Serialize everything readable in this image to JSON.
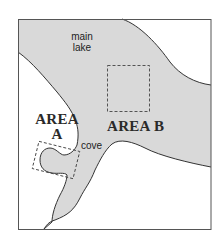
{
  "map": {
    "colors": {
      "water": "#d9d9d9",
      "land": "#ffffff",
      "shoreline": "#333333",
      "frame": "#555555",
      "area_box": "#444444"
    },
    "labels": {
      "main_lake_line1": "main",
      "main_lake_line2": "lake",
      "area_a_line1": "AREA",
      "area_a_line2": "A",
      "area_b": "AREA B",
      "cove": "cove"
    }
  }
}
